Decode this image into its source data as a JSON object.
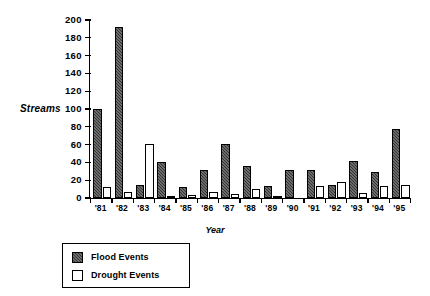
{
  "chart_data": {
    "type": "bar",
    "title": "",
    "xlabel": "Year",
    "ylabel": "Streams",
    "ylim": [
      0,
      200
    ],
    "ytick_step": 20,
    "yticks": [
      0,
      20,
      40,
      60,
      80,
      100,
      120,
      140,
      160,
      180,
      200
    ],
    "ytick_labels": [
      "0",
      "20",
      "40",
      "60",
      "80",
      "100",
      "120",
      "140",
      "160",
      "180",
      "200"
    ],
    "grid": false,
    "legend_position": "below-left",
    "categories": [
      "'81",
      "'82",
      "'83",
      "'84",
      "'85",
      "'86",
      "'87",
      "'88",
      "'89",
      "'90",
      "'91",
      "'92",
      "'93",
      "'94",
      "'95"
    ],
    "series": [
      {
        "name": "Flood Events",
        "color": "#333333",
        "fill": "hatched-dark",
        "values": [
          100,
          192,
          15,
          40,
          12,
          31,
          61,
          36,
          14,
          31,
          31,
          15,
          42,
          29,
          77
        ]
      },
      {
        "name": "Drought Events",
        "color": "#ffffff",
        "fill": "white-outline",
        "values": [
          12,
          7,
          61,
          1,
          3,
          7,
          5,
          10,
          2,
          0,
          14,
          18,
          6,
          13,
          15
        ]
      }
    ]
  },
  "legend": {
    "items": [
      {
        "label": "Flood Events",
        "swatch": "flood-swatch"
      },
      {
        "label": "Drought Events",
        "swatch": "drought-swatch"
      }
    ]
  }
}
